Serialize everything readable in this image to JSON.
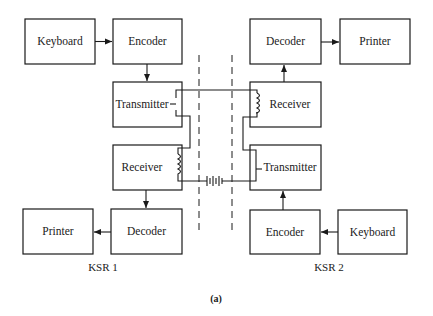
{
  "diagram": {
    "caption": "(a)",
    "stations": [
      {
        "label": "KSR 1",
        "blocks": {
          "keyboard": "Keyboard",
          "encoder": "Encoder",
          "transmitter": "Transmitter",
          "receiver": "Receiver",
          "decoder": "Decoder",
          "printer": "Printer"
        }
      },
      {
        "label": "KSR 2",
        "blocks": {
          "decoder": "Decoder",
          "printer": "Printer",
          "receiver": "Receiver",
          "transmitter": "Transmitter",
          "encoder": "Encoder",
          "keyboard": "Keyboard"
        }
      }
    ],
    "colors": {
      "ink": "#1a1a1a",
      "background": "#ffffff"
    }
  }
}
